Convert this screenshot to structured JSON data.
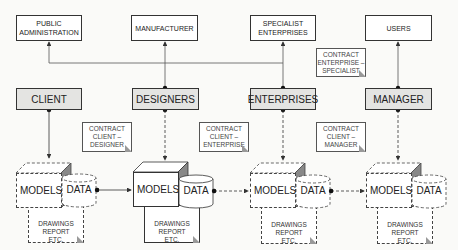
{
  "top_entities": [
    {
      "label_line1": "PUBLIC",
      "label_line2": "ADMINISTRATION"
    },
    {
      "label_line1": "MANUFACTURER",
      "label_line2": ""
    },
    {
      "label_line1": "SPECIALIST",
      "label_line2": "ENTERPRISES"
    },
    {
      "label_line1": "USERS",
      "label_line2": ""
    }
  ],
  "actors": [
    {
      "label": "CLIENT"
    },
    {
      "label": "DESIGNERS"
    },
    {
      "label": "ENTERPRISES"
    },
    {
      "label": "MANAGER"
    }
  ],
  "contracts": [
    {
      "line1": "CONTRACT",
      "line2": "CLIENT –",
      "line3": "DESIGNER"
    },
    {
      "line1": "CONTRACT",
      "line2": "CLIENT –",
      "line3": "ENTERPRISE"
    },
    {
      "line1": "CONTRACT",
      "line2": "CLIENT –",
      "line3": "MANAGER"
    },
    {
      "line1": "CONTRACT",
      "line2": "ENTERPRISE –",
      "line3": "SPECIALIST"
    }
  ],
  "stages": [
    {
      "models": "MODELS",
      "data": "DATA",
      "doc_line1": "DRAWINGS",
      "doc_line2": "REPORT",
      "doc_line3": "ETC.",
      "style": "dashed"
    },
    {
      "models": "MODELS",
      "data": "DATA",
      "doc_line1": "DRAWINGS",
      "doc_line2": "REPORT",
      "doc_line3": "ETC.",
      "style": "solid"
    },
    {
      "models": "MODELS",
      "data": "DATA",
      "doc_line1": "DRAWINGS",
      "doc_line2": "REPORT",
      "doc_line3": "ETC.",
      "style": "dashed"
    },
    {
      "models": "MODELS",
      "data": "DATA",
      "doc_line1": "DRAWINGS",
      "doc_line2": "REPORT",
      "doc_line3": "ETC.",
      "style": "dashed"
    }
  ],
  "colors": {
    "actor_fill": "#e4e4e2",
    "line": "#333333",
    "background": "#fafaf8"
  }
}
